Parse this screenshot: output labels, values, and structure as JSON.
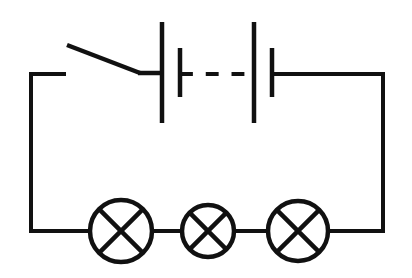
{
  "diagram": {
    "type": "electrical-schematic",
    "canvas": {
      "width": 412,
      "height": 278,
      "background": "#ffffff"
    },
    "stroke_color": "#111111",
    "stroke_width": 4
  },
  "layout": {
    "loop": {
      "left_x": 31,
      "right_x": 383,
      "top_y": 74,
      "bottom_y": 231
    }
  },
  "components": {
    "switch": {
      "name": "open-switch",
      "label": "Switch (open)",
      "state": "open",
      "left_terminal_x": 31,
      "left_terminal_end_x": 64,
      "pivot_x": 64,
      "pivot_y": 74,
      "blade_tip_x": 67,
      "blade_tip_y": 45,
      "blade_end_x": 140,
      "blade_end_y": 73,
      "contact_x": 162,
      "contact_y": 74
    },
    "battery": {
      "name": "multi-cell-battery",
      "label": "Battery (multiple cells)",
      "cell_count_shown": 2,
      "continuation": "dashed",
      "long_plate_top_y": 22,
      "long_plate_bottom_y": 123,
      "short_plate_top_y": 48,
      "short_plate_bottom_y": 97,
      "cells": [
        {
          "name": "cell-1",
          "long_plate_x": 162,
          "short_plate_x": 180
        },
        {
          "name": "cell-2",
          "long_plate_x": 254,
          "short_plate_x": 272
        }
      ],
      "dash_segment": {
        "x1": 180,
        "x2": 254,
        "y": 74,
        "dash_count": 3
      },
      "right_lead": {
        "x1": 272,
        "x2": 383,
        "y": 74
      }
    },
    "lamps": [
      {
        "name": "lamp-1",
        "label": "Lamp 1",
        "cx": 121,
        "cy": 231,
        "r": 31
      },
      {
        "name": "lamp-2",
        "label": "Lamp 2",
        "cx": 208,
        "cy": 231,
        "r": 26
      },
      {
        "name": "lamp-3",
        "label": "Lamp 3",
        "cx": 298,
        "cy": 231,
        "r": 30
      }
    ],
    "bottom_wires": [
      {
        "name": "wire-left-to-lamp1",
        "x1": 31,
        "x2": 90,
        "y": 231
      },
      {
        "name": "wire-lamp1-to-lamp2",
        "x1": 152,
        "x2": 182,
        "y": 231
      },
      {
        "name": "wire-lamp2-to-lamp3",
        "x1": 234,
        "x2": 268,
        "y": 231
      },
      {
        "name": "wire-lamp3-to-right",
        "x1": 328,
        "x2": 383,
        "y": 231
      }
    ],
    "side_wires": [
      {
        "name": "wire-left-side",
        "x": 31,
        "y1": 74,
        "y2": 231
      },
      {
        "name": "wire-right-side",
        "x": 383,
        "y1": 74,
        "y2": 231
      }
    ]
  }
}
